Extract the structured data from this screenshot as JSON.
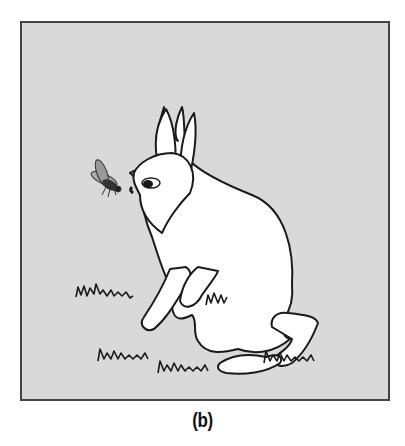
{
  "figure": {
    "caption": "(b)",
    "background_color": "#d9d9d9",
    "frame_color": "#444444",
    "subjects": [
      "rabbit",
      "fly",
      "grass-tufts"
    ]
  }
}
